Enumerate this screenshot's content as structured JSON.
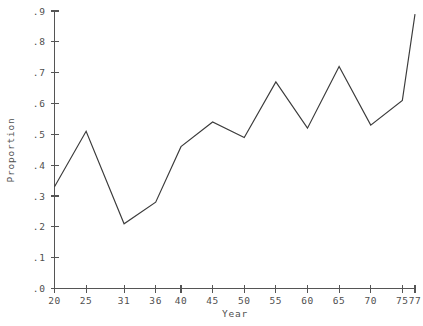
{
  "chart_data": {
    "type": "line",
    "title": "",
    "xlabel": "Year",
    "ylabel": "Proportion",
    "x": [
      20,
      25,
      31,
      36,
      40,
      45,
      50,
      55,
      60,
      65,
      70,
      75,
      77
    ],
    "values": [
      0.33,
      0.51,
      0.21,
      0.28,
      0.46,
      0.54,
      0.49,
      0.67,
      0.52,
      0.72,
      0.53,
      0.61,
      0.89
    ],
    "categories": [
      "20",
      "25",
      "31",
      "36",
      "40",
      "45",
      "50",
      "55",
      "60",
      "65",
      "70",
      "75",
      "77"
    ],
    "xtick_labels": [
      "20",
      "25",
      "31",
      "36",
      "40",
      "45",
      "50",
      "55",
      "60",
      "65",
      "70",
      "75",
      "77"
    ],
    "ytick_labels": [
      ".0",
      ".1",
      ".2",
      ".3",
      ".4",
      ".5",
      ".6",
      ".7",
      ".8",
      ".9"
    ],
    "ytick_values": [
      0.0,
      0.1,
      0.2,
      0.3,
      0.4,
      0.5,
      0.6,
      0.7,
      0.8,
      0.9
    ],
    "ylim": [
      0.0,
      0.9
    ],
    "xlim": [
      20,
      77
    ],
    "grid": false,
    "legend": false,
    "series": [
      {
        "name": "Proportion",
        "color": "#3b3b3b",
        "points": [
          {
            "x": 20,
            "y": 0.33
          },
          {
            "x": 25,
            "y": 0.51
          },
          {
            "x": 31,
            "y": 0.21
          },
          {
            "x": 36,
            "y": 0.28
          },
          {
            "x": 40,
            "y": 0.46
          },
          {
            "x": 45,
            "y": 0.54
          },
          {
            "x": 50,
            "y": 0.49
          },
          {
            "x": 55,
            "y": 0.67
          },
          {
            "x": 60,
            "y": 0.52
          },
          {
            "x": 65,
            "y": 0.72
          },
          {
            "x": 70,
            "y": 0.53
          },
          {
            "x": 75,
            "y": 0.61
          },
          {
            "x": 77,
            "y": 0.89
          }
        ]
      }
    ]
  },
  "axes": {
    "x_title": "Year",
    "y_title": "Proportion"
  },
  "colors": {
    "line": "#3b3b3b",
    "axis": "#555555",
    "text": "#4f4f4f",
    "background": "#ffffff"
  }
}
